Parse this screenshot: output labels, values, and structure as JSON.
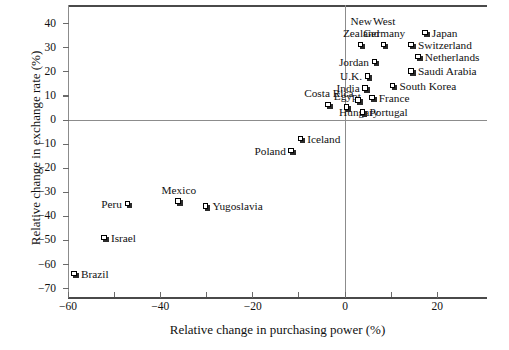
{
  "chart_data": {
    "type": "scatter",
    "title": "",
    "xlabel": "Relative change in purchasing power (%)",
    "ylabel": "Relative change in exchange rate (%)",
    "xlim": [
      -62,
      29
    ],
    "ylim": [
      -70,
      45
    ],
    "xticks": [
      -60,
      -40,
      -20,
      0,
      20
    ],
    "xticklabels": [
      "−60",
      "−40",
      "−20",
      "0",
      "20"
    ],
    "yticks": [
      40,
      30,
      20,
      10,
      0,
      -10,
      -20,
      -30,
      -40,
      -50,
      -60,
      -70
    ],
    "yticklabels": [
      "40",
      "30",
      "20",
      "10",
      "0",
      "−10",
      "−20",
      "−30",
      "−40",
      "−50",
      "−60",
      "−70"
    ],
    "grid": false,
    "legend": "none",
    "marker": "square-with-shadow",
    "reference_lines": [
      {
        "axis": "y",
        "value": 0
      },
      {
        "axis": "x",
        "value": 0
      }
    ],
    "points": [
      {
        "label": "Japan",
        "x": 17.5,
        "y": 36,
        "label_pos": "right"
      },
      {
        "label": "Switzerland",
        "x": 14.5,
        "y": 31,
        "label_pos": "right"
      },
      {
        "label": "Netherlands",
        "x": 16.0,
        "y": 26,
        "label_pos": "right"
      },
      {
        "label": "Saudi Arabia",
        "x": 14.5,
        "y": 20,
        "label_pos": "right"
      },
      {
        "label": "South Korea",
        "x": 10.5,
        "y": 14,
        "label_pos": "right"
      },
      {
        "label": "France",
        "x": 6.0,
        "y": 9,
        "label_pos": "right"
      },
      {
        "label": "West\nGermany",
        "x": 8.5,
        "y": 31,
        "label_pos": "above"
      },
      {
        "label": "New\nZealand",
        "x": 3.5,
        "y": 31,
        "label_pos": "above"
      },
      {
        "label": "Jordan",
        "x": 6.5,
        "y": 24,
        "label_pos": "left"
      },
      {
        "label": "U.K.",
        "x": 5.0,
        "y": 18,
        "label_pos": "left"
      },
      {
        "label": "India",
        "x": 4.5,
        "y": 13,
        "label_pos": "left"
      },
      {
        "label": "Hungary",
        "x": 3.0,
        "y": 8,
        "label_pos": "below"
      },
      {
        "label": "Portugal",
        "x": 4.0,
        "y": 3,
        "label_pos": "right"
      },
      {
        "label": "Egypt",
        "x": 0.5,
        "y": 5,
        "label_pos": "above"
      },
      {
        "label": "Costa Rica",
        "x": -3.5,
        "y": 6,
        "label_pos": "above"
      },
      {
        "label": "Iceland",
        "x": -9.5,
        "y": -8,
        "label_pos": "right"
      },
      {
        "label": "Poland",
        "x": -11.5,
        "y": -13,
        "label_pos": "left"
      },
      {
        "label": "Mexico",
        "x": -36.0,
        "y": -34,
        "label_pos": "above"
      },
      {
        "label": "Yugoslavia",
        "x": -30.0,
        "y": -36,
        "label_pos": "right"
      },
      {
        "label": "Peru",
        "x": -47.0,
        "y": -35,
        "label_pos": "left"
      },
      {
        "label": "Israel",
        "x": -52.0,
        "y": -49,
        "label_pos": "right"
      },
      {
        "label": "Brazil",
        "x": -58.5,
        "y": -64,
        "label_pos": "right"
      }
    ]
  }
}
